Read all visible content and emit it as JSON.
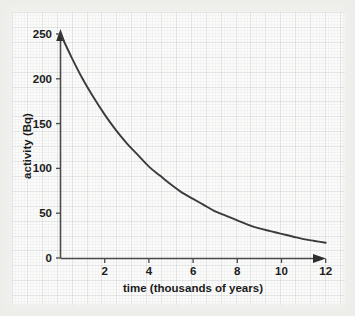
{
  "chart_data": {
    "type": "line",
    "title": "",
    "xlabel": "time (thousands of years)",
    "ylabel": "activity (Bq)",
    "xlim": [
      0,
      12
    ],
    "ylim": [
      0,
      250
    ],
    "xticks": [
      2,
      4,
      6,
      8,
      10,
      12
    ],
    "yticks": [
      0,
      50,
      100,
      150,
      200,
      250
    ],
    "grid": true,
    "legend": "none",
    "series": [
      {
        "name": "activity decay",
        "x": [
          0,
          0.5,
          1,
          1.5,
          2,
          2.5,
          3,
          3.5,
          4,
          4.5,
          5,
          5.5,
          6,
          6.5,
          7,
          7.5,
          8,
          8.5,
          9,
          9.5,
          10,
          10.5,
          11,
          11.5,
          12
        ],
        "y": [
          250,
          224,
          200,
          179,
          160,
          143,
          128,
          115,
          102,
          92,
          82,
          73,
          66,
          59,
          52,
          47,
          42,
          37,
          33,
          30,
          27,
          24,
          21,
          19,
          17
        ]
      }
    ],
    "annotations": {
      "curve_shape": "exponential decay",
      "initial_activity": 250,
      "half_life_thousands_years": 3.2
    },
    "axis_arrows": {
      "x_axis_arrow": "arrow-right",
      "y_axis_arrow": "arrow-up"
    }
  },
  "xtick_labels": [
    "2",
    "4",
    "6",
    "8",
    "10",
    "12"
  ],
  "ytick_labels": [
    "0",
    "50",
    "100",
    "150",
    "200",
    "250"
  ],
  "colors": {
    "curve": "#3b3b3b",
    "axis": "#4a4a4a",
    "text": "#1b1b1b",
    "grid_minor": "#e8e9ea",
    "grid_major": "#dcdee1",
    "background": "#f2f2f0",
    "plot_background": "#fbfbfa"
  }
}
